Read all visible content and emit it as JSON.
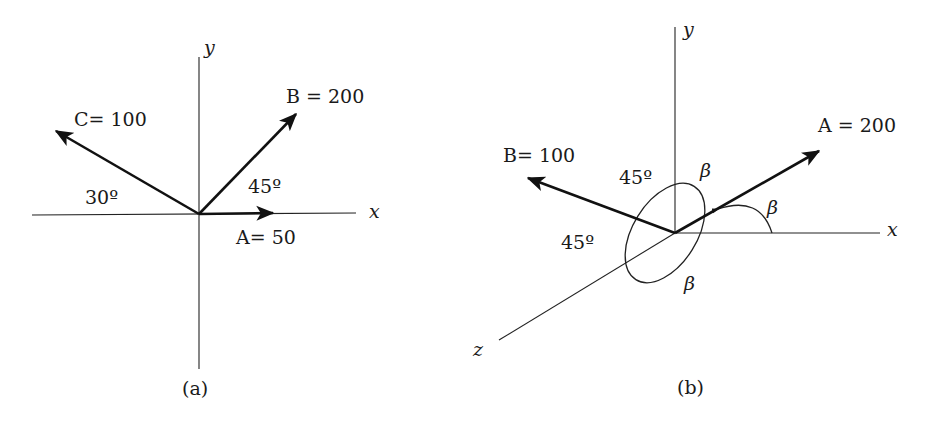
{
  "panel_a": {
    "caption": "(a)",
    "axis_x": "x",
    "axis_y": "y",
    "vectors": [
      {
        "name": "A",
        "label": "A= 50",
        "magnitude": 50,
        "angle_deg": 0
      },
      {
        "name": "B",
        "label": "B = 200",
        "magnitude": 200,
        "angle_deg": 45
      },
      {
        "name": "C",
        "label": "C= 100",
        "magnitude": 100,
        "angle_deg": 150
      }
    ],
    "angle_labels": [
      "45º",
      "30º"
    ]
  },
  "panel_b": {
    "caption": "(b)",
    "axis_x": "x",
    "axis_y": "y",
    "axis_z": "z",
    "vectors": [
      {
        "name": "A",
        "label": "A = 200",
        "magnitude": 200
      },
      {
        "name": "B",
        "label": "B= 100",
        "magnitude": 100
      }
    ],
    "angle_labels": [
      "45º",
      "45º",
      "β",
      "β",
      "β"
    ]
  }
}
